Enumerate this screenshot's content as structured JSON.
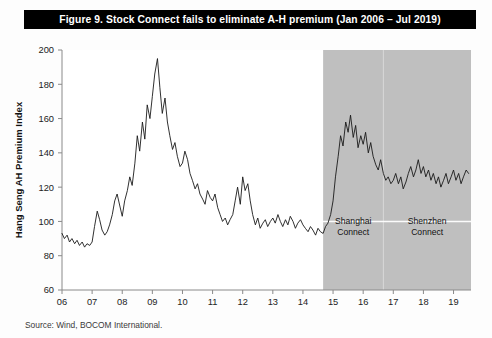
{
  "figure": {
    "title": "Figure 9.  Stock Connect fails to eliminate A-H premium (Jan 2006 – Jul 2019)",
    "source": "Source: Wind, BOCOM International."
  },
  "chart_data": {
    "type": "line",
    "title": "Figure 9.  Stock Connect fails to eliminate A-H premium (Jan 2006 – Jul 2019)",
    "xlabel": "Year",
    "ylabel": "Hang Seng AH Premium Index",
    "xlim": [
      2006.0,
      2019.58
    ],
    "ylim": [
      60,
      200
    ],
    "yticks": [
      60,
      80,
      100,
      120,
      140,
      160,
      180,
      200
    ],
    "xticks": [
      2006,
      2007,
      2008,
      2009,
      2010,
      2011,
      2012,
      2013,
      2014,
      2015,
      2016,
      2017,
      2018,
      2019
    ],
    "xtick_labels": [
      "06",
      "07",
      "08",
      "09",
      "10",
      "11",
      "12",
      "13",
      "14",
      "15",
      "16",
      "17",
      "18",
      "19"
    ],
    "grid": false,
    "legend": null,
    "series": [
      {
        "name": "Hang Seng AH Premium Index",
        "color": "#1a1a1a",
        "x": [
          2006.0,
          2006.08,
          2006.17,
          2006.25,
          2006.33,
          2006.42,
          2006.5,
          2006.58,
          2006.67,
          2006.75,
          2006.83,
          2006.92,
          2007.0,
          2007.08,
          2007.17,
          2007.25,
          2007.33,
          2007.42,
          2007.5,
          2007.58,
          2007.67,
          2007.75,
          2007.83,
          2007.92,
          2008.0,
          2008.08,
          2008.17,
          2008.25,
          2008.33,
          2008.42,
          2008.5,
          2008.58,
          2008.67,
          2008.75,
          2008.83,
          2008.92,
          2009.0,
          2009.08,
          2009.17,
          2009.25,
          2009.33,
          2009.42,
          2009.5,
          2009.58,
          2009.67,
          2009.75,
          2009.83,
          2009.92,
          2010.0,
          2010.08,
          2010.17,
          2010.25,
          2010.33,
          2010.42,
          2010.5,
          2010.58,
          2010.67,
          2010.75,
          2010.83,
          2010.92,
          2011.0,
          2011.08,
          2011.17,
          2011.25,
          2011.33,
          2011.42,
          2011.5,
          2011.58,
          2011.67,
          2011.75,
          2011.83,
          2011.92,
          2012.0,
          2012.08,
          2012.17,
          2012.25,
          2012.33,
          2012.42,
          2012.5,
          2012.58,
          2012.67,
          2012.75,
          2012.83,
          2012.92,
          2013.0,
          2013.08,
          2013.17,
          2013.25,
          2013.33,
          2013.42,
          2013.5,
          2013.58,
          2013.67,
          2013.75,
          2013.83,
          2013.92,
          2014.0,
          2014.08,
          2014.17,
          2014.25,
          2014.33,
          2014.42,
          2014.5,
          2014.58,
          2014.67,
          2014.75,
          2014.83,
          2014.92,
          2015.0,
          2015.08,
          2015.17,
          2015.25,
          2015.33,
          2015.42,
          2015.5,
          2015.58,
          2015.67,
          2015.75,
          2015.83,
          2015.92,
          2016.0,
          2016.08,
          2016.17,
          2016.25,
          2016.33,
          2016.42,
          2016.5,
          2016.58,
          2016.67,
          2016.75,
          2016.83,
          2016.92,
          2017.0,
          2017.08,
          2017.17,
          2017.25,
          2017.33,
          2017.42,
          2017.5,
          2017.58,
          2017.67,
          2017.75,
          2017.83,
          2017.92,
          2018.0,
          2018.08,
          2018.17,
          2018.25,
          2018.33,
          2018.42,
          2018.5,
          2018.58,
          2018.67,
          2018.75,
          2018.83,
          2018.92,
          2019.0,
          2019.08,
          2019.17,
          2019.25,
          2019.33,
          2019.42,
          2019.5
        ],
        "y": [
          93,
          90,
          92,
          88,
          90,
          87,
          89,
          86,
          88,
          85,
          87,
          86,
          88,
          97,
          106,
          101,
          95,
          92,
          94,
          98,
          104,
          112,
          116,
          109,
          103,
          112,
          118,
          126,
          121,
          134,
          150,
          141,
          158,
          148,
          168,
          160,
          173,
          186,
          195,
          178,
          163,
          172,
          158,
          150,
          142,
          146,
          138,
          132,
          134,
          141,
          136,
          128,
          124,
          119,
          122,
          116,
          113,
          110,
          118,
          114,
          112,
          116,
          108,
          104,
          100,
          102,
          98,
          101,
          104,
          112,
          120,
          110,
          126,
          118,
          122,
          112,
          104,
          98,
          102,
          96,
          99,
          101,
          97,
          100,
          102,
          99,
          104,
          100,
          97,
          101,
          98,
          103,
          100,
          96,
          99,
          101,
          98,
          96,
          94,
          97,
          95,
          92,
          96,
          94,
          93,
          97,
          99,
          104,
          112,
          126,
          138,
          150,
          144,
          158,
          152,
          162,
          149,
          156,
          143,
          150,
          145,
          152,
          140,
          146,
          138,
          133,
          130,
          136,
          128,
          124,
          126,
          122,
          124,
          128,
          122,
          126,
          119,
          123,
          128,
          132,
          126,
          130,
          136,
          128,
          132,
          126,
          130,
          124,
          128,
          122,
          126,
          120,
          124,
          128,
          122,
          126,
          130,
          124,
          128,
          122,
          126,
          130,
          128
        ]
      }
    ],
    "shaded_regions": [
      {
        "name": "Shanghai Connect",
        "label": "Shanghai\nConnect",
        "label_line1": "Shanghai",
        "label_line2": "Connect",
        "x_start": 2014.67,
        "x_end": 2016.67,
        "color": "#bfbfbf"
      },
      {
        "name": "Shenzhen Connect",
        "label": "Shenzhen\nConnect",
        "label_line1": "Shenzhen",
        "label_line2": "Connect",
        "x_start": 2016.67,
        "x_end": 2019.58,
        "color": "#bfbfbf"
      }
    ],
    "reference_line": {
      "value": 100,
      "color": "#ffffff"
    }
  }
}
